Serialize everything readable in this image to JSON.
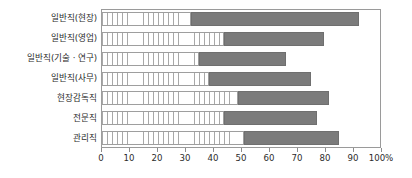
{
  "chart_data": {
    "type": "bar",
    "orientation": "horizontal",
    "stacked": true,
    "title": "",
    "subtitle": "",
    "xlabel": "",
    "ylabel": "",
    "xlim": [
      0,
      100
    ],
    "grid": false,
    "legend": "none",
    "categories": [
      "일반직(현장)",
      "일반직(영업)",
      "일반직(기술 · 연구)",
      "일반직(사무)",
      "현장감독직",
      "전문직",
      "관리직"
    ],
    "series": [
      {
        "name": "segment-1",
        "style": "hatched",
        "color": "#ffffff",
        "values": [
          32,
          44,
          35,
          38.5,
          49,
          44,
          51
        ]
      },
      {
        "name": "segment-2",
        "style": "solid",
        "color": "#7b7b7b",
        "values": [
          60,
          35.5,
          31,
          36.5,
          32.5,
          33,
          34
        ]
      }
    ],
    "cumulative_ends": [
      92,
      79.5,
      66,
      75,
      81.5,
      77,
      85
    ],
    "xticks": [
      0,
      10,
      20,
      30,
      40,
      50,
      60,
      70,
      80,
      90,
      100
    ],
    "xticklabels": [
      "0",
      "10",
      "20",
      "30",
      "40",
      "50",
      "60",
      "70",
      "80",
      "90",
      "100%"
    ]
  },
  "colors": {
    "bar_fill": "#7b7b7b",
    "hatch_line": "#a8a8a8",
    "frame": "#9a9a9a",
    "text": "#2b2b2b",
    "background": "#ffffff"
  }
}
